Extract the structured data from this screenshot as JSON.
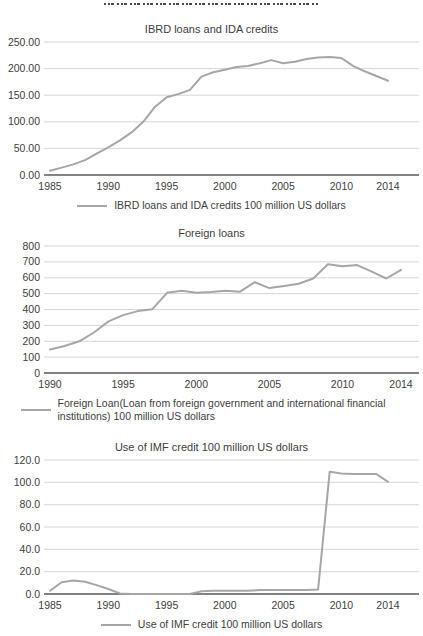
{
  "colors": {
    "line": "#a6a6a6",
    "gridline": "#d6d6d6",
    "axis_line": "#595959",
    "text": "#404040"
  },
  "chart_data": [
    {
      "type": "line",
      "title": "IBRD loans and IDA credits",
      "legend": "IBRD loans and IDA credits 100 million US dollars",
      "x": [
        1985,
        1986,
        1987,
        1988,
        1989,
        1990,
        1991,
        1992,
        1993,
        1994,
        1995,
        1996,
        1997,
        1998,
        1999,
        2000,
        2001,
        2002,
        2003,
        2004,
        2005,
        2006,
        2007,
        2008,
        2009,
        2010,
        2011,
        2012,
        2013,
        2014
      ],
      "values": [
        8,
        14,
        20,
        28,
        40,
        52,
        65,
        80,
        100,
        128,
        146,
        152,
        160,
        185,
        193,
        198,
        203,
        205,
        210,
        216,
        210,
        213,
        218,
        221,
        222,
        220,
        205,
        195,
        186,
        177
      ],
      "xticks": [
        1985,
        1990,
        1995,
        2000,
        2005,
        2010,
        2014
      ],
      "ytick_values": [
        0,
        50,
        100,
        150,
        200,
        250
      ],
      "ytick_labels": [
        "0.00",
        "50.00",
        "100.00",
        "150.00",
        "200.00",
        "250.00"
      ],
      "ylim": [
        0,
        250
      ],
      "grid": true,
      "legend_position": "bottom"
    },
    {
      "type": "line",
      "title": "Foreign loans",
      "legend": "Foreign Loan(Loan from foreign government and international financial institutions) 100 million US dollars",
      "x": [
        1990,
        1991,
        1992,
        1993,
        1994,
        1995,
        1996,
        1997,
        1998,
        1999,
        2000,
        2001,
        2002,
        2003,
        2004,
        2005,
        2006,
        2007,
        2008,
        2009,
        2010,
        2011,
        2012,
        2013,
        2014
      ],
      "values": [
        148,
        170,
        200,
        255,
        325,
        365,
        390,
        402,
        505,
        518,
        505,
        510,
        518,
        512,
        572,
        535,
        548,
        562,
        595,
        685,
        672,
        680,
        638,
        595,
        650
      ],
      "xticks": [
        1990,
        1995,
        2000,
        2005,
        2010,
        2014
      ],
      "ytick_values": [
        0,
        100,
        200,
        300,
        400,
        500,
        600,
        700,
        800
      ],
      "ytick_labels": [
        "0",
        "100",
        "200",
        "300",
        "400",
        "500",
        "600",
        "700",
        "800"
      ],
      "ylim": [
        0,
        800
      ],
      "grid": true,
      "legend_position": "bottom"
    },
    {
      "type": "line",
      "title": "Use of IMF credit 100 million US dollars",
      "legend": "Use of IMF credit 100 million US dollars",
      "x": [
        1985,
        1986,
        1987,
        1988,
        1989,
        1990,
        1991,
        1992,
        1993,
        1994,
        1995,
        1996,
        1997,
        1998,
        1999,
        2000,
        2001,
        2002,
        2003,
        2004,
        2005,
        2006,
        2007,
        2008,
        2009,
        2010,
        2011,
        2012,
        2013,
        2014
      ],
      "values": [
        3,
        10.5,
        12,
        11,
        8,
        4.5,
        0.5,
        0,
        0,
        0,
        0,
        0,
        0,
        2.5,
        3,
        3,
        3,
        3,
        3.5,
        3.5,
        3.5,
        3.5,
        3.5,
        4,
        109.5,
        108,
        107.5,
        107.5,
        107.5,
        100.5
      ],
      "xticks": [
        1985,
        1990,
        1995,
        2000,
        2005,
        2010,
        2014
      ],
      "ytick_values": [
        0,
        20,
        40,
        60,
        80,
        100,
        120
      ],
      "ytick_labels": [
        "0.0",
        "20.0",
        "40.0",
        "60.0",
        "80.0",
        "100.0",
        "120.0"
      ],
      "ylim": [
        0,
        120
      ],
      "grid": true,
      "legend_position": "bottom"
    }
  ]
}
